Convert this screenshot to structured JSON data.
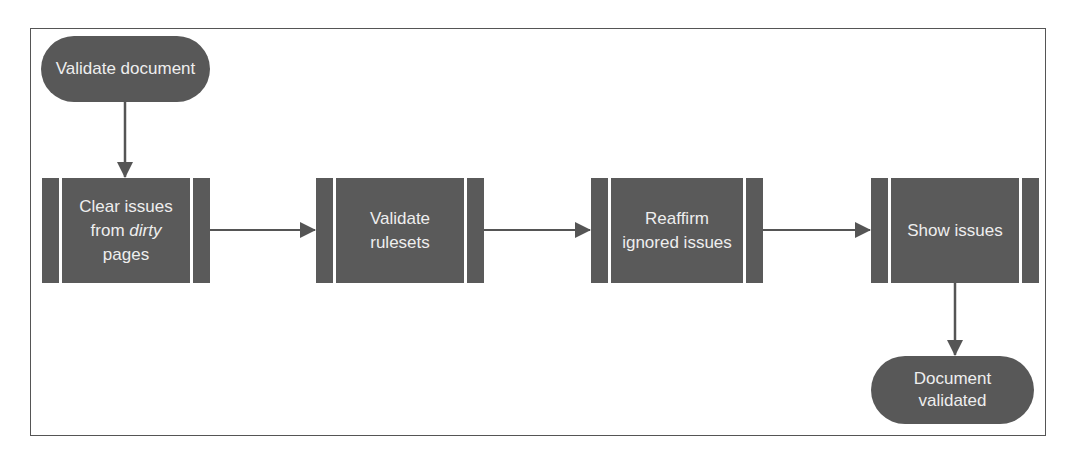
{
  "diagram": {
    "type": "flowchart",
    "start": {
      "label": "Validate document"
    },
    "steps": [
      {
        "id": "clear",
        "line1": "Clear issues",
        "line2_pre": "from ",
        "line2_em": "dirty",
        "line3": "pages"
      },
      {
        "id": "validate",
        "line1": "Validate",
        "line2": "rulesets"
      },
      {
        "id": "reaffirm",
        "line1": "Reaffirm",
        "line2": "ignored issues"
      },
      {
        "id": "show",
        "line1": "Show issues"
      }
    ],
    "end": {
      "line1": "Document",
      "line2": "validated"
    },
    "edges": [
      {
        "from": "Validate document",
        "to": "Clear issues from dirty pages"
      },
      {
        "from": "Clear issues from dirty pages",
        "to": "Validate rulesets"
      },
      {
        "from": "Validate rulesets",
        "to": "Reaffirm ignored issues"
      },
      {
        "from": "Reaffirm ignored issues",
        "to": "Show issues"
      },
      {
        "from": "Show issues",
        "to": "Document validated"
      }
    ],
    "colors": {
      "node_fill": "#5a5a5a",
      "node_text": "#eeeeee",
      "connector": "#555555",
      "frame": "#555555"
    }
  }
}
